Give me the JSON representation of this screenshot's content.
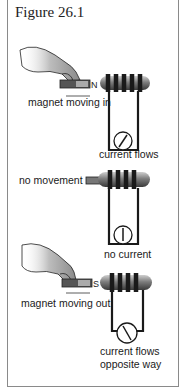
{
  "figure": {
    "title": "Figure 26.1"
  },
  "panels": [
    {
      "id": "moving-in",
      "caption": "magnet moving in",
      "result": "current flows",
      "pole_label": "N",
      "needle": "deflected-right"
    },
    {
      "id": "no-movement",
      "caption": "no movement",
      "result": "no current",
      "needle": "center"
    },
    {
      "id": "moving-out",
      "caption": "magnet moving out",
      "result_line1": "current flows",
      "result_line2": "opposite way",
      "pole_label": "S",
      "needle": "deflected-left"
    }
  ],
  "colors": {
    "ink": "#1a1a1a",
    "coil": "#2a2a2a",
    "core": "#7a7a7a",
    "frame": "#8a8a8a"
  }
}
